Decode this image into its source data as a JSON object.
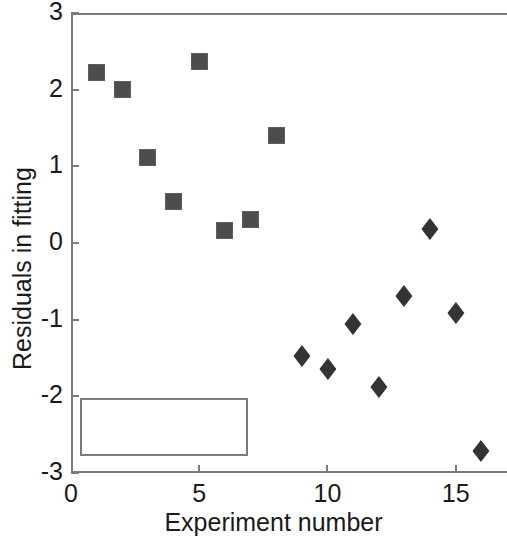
{
  "chart_data": {
    "type": "scatter",
    "title": "",
    "xlabel": "Experiment number",
    "ylabel": "Residuals in fitting",
    "xlim": [
      0,
      17
    ],
    "ylim": [
      -3,
      3
    ],
    "xticks": [
      0,
      5,
      10,
      15
    ],
    "yticks": [
      3,
      2,
      1,
      0,
      -1,
      -2,
      -3
    ],
    "xtick_labels": [
      "0",
      "5",
      "10",
      "15"
    ],
    "ytick_labels": [
      "3",
      "2",
      "1",
      "0",
      "-1",
      "-2",
      "-3"
    ],
    "grid": false,
    "legend_position": "lower left",
    "marker_color": "#4d4d4d",
    "series": [
      {
        "name": "Block-1",
        "marker": "square",
        "color": "#4d4d4d",
        "x": [
          1,
          2,
          3,
          4,
          5,
          6,
          7,
          8
        ],
        "y": [
          2.22,
          2.0,
          1.12,
          0.54,
          2.37,
          0.16,
          0.31,
          1.4
        ]
      },
      {
        "name": "Block-2",
        "marker": "diamond",
        "color": "#333333",
        "x": [
          9,
          10,
          11,
          12,
          13,
          14,
          15,
          16
        ],
        "y": [
          -1.47,
          -1.64,
          -1.06,
          -1.88,
          -0.69,
          0.18,
          -0.91,
          -2.72
        ]
      }
    ]
  },
  "legend": {
    "entries": [
      {
        "label": "Block-1",
        "marker": "square"
      },
      {
        "label": "Block-2",
        "marker": "diamond"
      }
    ]
  },
  "axes": {
    "frame_color": "#7a7a7a"
  }
}
